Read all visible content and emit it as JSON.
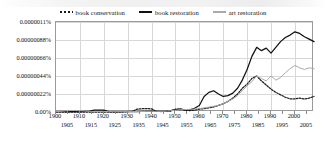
{
  "chart_data": {
    "type": "line",
    "title": "",
    "subtitle": "",
    "xlabel": "",
    "ylabel": "",
    "xlim": [
      1900,
      2008
    ],
    "ylim": [
      0,
      1.1e-06
    ],
    "grid": true,
    "legend_position": "top-center",
    "y_tick_labels": [
      "0.00%",
      "0.00000022%",
      "0.00000044%",
      "0.00000066%",
      "0.00000088%",
      "0.0000011%"
    ],
    "y_tick_values": [
      0,
      2.2e-07,
      4.4e-07,
      6.6e-07,
      8.8e-07,
      1.1e-06
    ],
    "x_tick_labels": [
      "1900",
      "1905",
      "1910",
      "1915",
      "1920",
      "1925",
      "1930",
      "1935",
      "1940",
      "1945",
      "1950",
      "1955",
      "1960",
      "1965",
      "1970",
      "1975",
      "1980",
      "1985",
      "1990",
      "1995",
      "2000",
      "2005"
    ],
    "x_tick_values": [
      1900,
      1905,
      1910,
      1915,
      1920,
      1925,
      1930,
      1935,
      1940,
      1945,
      1950,
      1955,
      1960,
      1965,
      1970,
      1975,
      1980,
      1985,
      1990,
      1995,
      2000,
      2005
    ],
    "x_gridline_values": [
      1910,
      1920,
      1930,
      1940,
      1950,
      1960,
      1970,
      1980,
      1990,
      2000
    ],
    "legend": [
      "book conservation",
      "book restoration",
      "art restoration"
    ],
    "x": [
      1900,
      1902,
      1904,
      1906,
      1908,
      1910,
      1912,
      1914,
      1916,
      1918,
      1920,
      1922,
      1924,
      1926,
      1928,
      1930,
      1932,
      1934,
      1936,
      1938,
      1940,
      1942,
      1944,
      1946,
      1948,
      1950,
      1952,
      1954,
      1956,
      1958,
      1960,
      1962,
      1964,
      1966,
      1968,
      1970,
      1972,
      1974,
      1976,
      1978,
      1980,
      1982,
      1984,
      1986,
      1988,
      1990,
      1992,
      1994,
      1996,
      1998,
      2000,
      2002,
      2004,
      2006,
      2008
    ],
    "series": [
      {
        "name": "book conservation",
        "style": "dotted",
        "color": "#1a1a1a",
        "values": [
          0.0,
          0.0,
          0.0,
          0.0,
          0.0,
          0.0,
          0.0,
          0.0,
          0.0,
          0.0,
          0.0,
          0.0,
          0.0,
          0.0,
          0.0,
          5e-09,
          1e-08,
          3.5e-08,
          4e-08,
          4.2e-08,
          3.8e-08,
          8e-09,
          6e-09,
          8e-09,
          1e-08,
          3.5e-08,
          3.8e-08,
          2e-08,
          1.8e-08,
          2.2e-08,
          3.5e-08,
          4e-08,
          5e-08,
          6.2e-08,
          8e-08,
          1e-07,
          1.3e-07,
          1.7e-07,
          2.2e-07,
          2.9e-07,
          3.4e-07,
          4.1e-07,
          4.4e-07,
          3.8e-07,
          3.3e-07,
          2.8e-07,
          2.4e-07,
          2.1e-07,
          1.8e-07,
          1.6e-07,
          1.6e-07,
          1.7e-07,
          1.6e-07,
          1.7e-07,
          1.9e-07
        ]
      },
      {
        "name": "book restoration",
        "style": "solid",
        "color": "#111111",
        "values": [
          5e-09,
          4e-09,
          4e-09,
          4e-09,
          5e-09,
          6e-09,
          8e-09,
          1e-08,
          2.2e-08,
          2.4e-08,
          2.4e-08,
          6e-09,
          5e-09,
          5e-09,
          5e-09,
          6e-09,
          6e-09,
          6e-09,
          7e-09,
          8e-09,
          1e-08,
          8e-09,
          8e-09,
          1e-08,
          1.6e-08,
          3e-08,
          3.2e-08,
          2.8e-08,
          2.6e-08,
          4.5e-08,
          8e-08,
          1.9e-07,
          2.4e-07,
          2.6e-07,
          2.2e-07,
          1.9e-07,
          2e-07,
          2.3e-07,
          2.9e-07,
          3.9e-07,
          5.2e-07,
          6.8e-07,
          7.9e-07,
          7.5e-07,
          7.8e-07,
          7.2e-07,
          7.9e-07,
          8.6e-07,
          9.1e-07,
          9.4e-07,
          9.8e-07,
          9.6e-07,
          9.2e-07,
          8.9e-07,
          8.6e-07
        ]
      },
      {
        "name": "art restoration",
        "style": "solid",
        "color": "#aaaaaa",
        "values": [
          4e-09,
          8e-09,
          1.4e-08,
          1.8e-08,
          1.8e-08,
          1.6e-08,
          1.2e-08,
          8e-09,
          6e-09,
          6e-09,
          6e-09,
          5e-09,
          5e-09,
          5e-09,
          5e-09,
          5e-09,
          6e-09,
          6e-09,
          6e-09,
          7e-09,
          8e-09,
          8e-09,
          8e-09,
          1e-08,
          1.6e-08,
          2.2e-08,
          2.8e-08,
          3e-08,
          3.2e-08,
          3.6e-08,
          4.2e-08,
          5e-08,
          6e-08,
          7e-08,
          8e-08,
          1e-07,
          1.3e-07,
          1.6e-07,
          2e-07,
          2.6e-07,
          3.2e-07,
          3.7e-07,
          4.4e-07,
          4.1e-07,
          3.8e-07,
          4.4e-07,
          3.9e-07,
          4.2e-07,
          4.8e-07,
          5.3e-07,
          5.7e-07,
          5.4e-07,
          5.2e-07,
          5.4e-07,
          5.3e-07
        ]
      }
    ]
  }
}
